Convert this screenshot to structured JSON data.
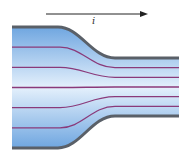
{
  "diagram": {
    "current_label": "i",
    "arrow_direction": "right",
    "streamline_count": 5,
    "colors": {
      "fill_light": "#e4f0fc",
      "fill_dark": "#6fa6e0",
      "wall": "#5a6068",
      "streamline": "#8a3a7a",
      "arrow": "#222222"
    }
  }
}
